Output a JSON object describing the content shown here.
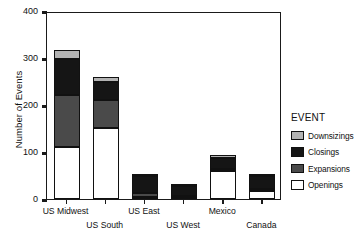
{
  "chart_data": {
    "type": "bar",
    "subtype": "stacked-bar",
    "title": "",
    "xlabel": "",
    "ylabel": "Number of Events",
    "ylim": [
      0,
      400
    ],
    "yticks": [
      0,
      100,
      200,
      300,
      400
    ],
    "grid": false,
    "legend_position": "right-outside",
    "legend_title": "EVENT",
    "categories": [
      "US Midwest",
      "US South",
      "US East",
      "US West",
      "Mexico",
      "Canada"
    ],
    "stack_order_bottom_to_top": [
      "Openings",
      "Expansions",
      "Closings",
      "Downsizings"
    ],
    "series": [
      {
        "name": "Openings",
        "color": "#ffffff",
        "values": [
          110,
          152,
          4,
          2,
          60,
          18
        ]
      },
      {
        "name": "Expansions",
        "color": "#4a4a4a",
        "values": [
          112,
          58,
          8,
          4,
          3,
          3
        ]
      },
      {
        "name": "Closings",
        "color": "#151515",
        "values": [
          75,
          40,
          36,
          22,
          25,
          27
        ]
      },
      {
        "name": "Downsizings",
        "color": "#b3b3b3",
        "values": [
          20,
          10,
          5,
          4,
          5,
          5
        ]
      }
    ],
    "totals": [
      317,
      260,
      53,
      32,
      93,
      53
    ]
  },
  "axes": {
    "y_title": "Number of Events",
    "y_tick_labels": [
      "0",
      "100",
      "200",
      "300",
      "400"
    ]
  },
  "legend": {
    "title": "EVENT",
    "items": [
      {
        "label": "Downsizings",
        "color": "#b3b3b3"
      },
      {
        "label": "Closings",
        "color": "#151515"
      },
      {
        "label": "Expansions",
        "color": "#4a4a4a"
      },
      {
        "label": "Openings",
        "color": "#ffffff"
      }
    ]
  },
  "x_axis_labels": [
    {
      "label": "US Midwest",
      "row": 0
    },
    {
      "label": "US South",
      "row": 1
    },
    {
      "label": "US East",
      "row": 0
    },
    {
      "label": "US West",
      "row": 1
    },
    {
      "label": "Mexico",
      "row": 0
    },
    {
      "label": "Canada",
      "row": 1
    }
  ]
}
